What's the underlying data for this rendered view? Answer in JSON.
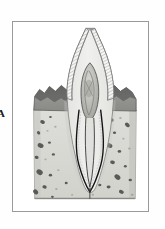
{
  "figure": {
    "label": "A",
    "caption_visible": false,
    "frame": {
      "x": 12,
      "y": 21,
      "width": 137,
      "height": 191,
      "border_color": "#9a9a9a",
      "background": "#ffffff"
    }
  },
  "colors": {
    "paper": "#ffffff",
    "page_background": "#fefefe",
    "frame_border": "#9a9a9a",
    "enamel_fill": "#f4f4f2",
    "enamel_hatch": "#8d8d8d",
    "dentin_fill": "#ececea",
    "dentin_outline": "#6f6f6f",
    "pulp_fill": "#c9c9c5",
    "pulp_outline": "#5a5a5a",
    "pulp_inner": "#9e9e99",
    "gingiva_fill": "#8f8f8c",
    "gingiva_dark": "#6e6e6b",
    "gingiva_outline": "#4a4a48",
    "bone_fill": "#d7d7d2",
    "bone_speckle": "#4f4f4d",
    "bone_speckle_light": "#8f8f8a",
    "bone_outline": "#7a7a77",
    "pdl_line": "#1c1c1c",
    "root_canal_line": "#2a2a2a"
  },
  "structures": [
    {
      "name": "enamel-crown",
      "label": "Enamel (hatched crown)",
      "shading": "fine diagonal hatch lines"
    },
    {
      "name": "dentin",
      "label": "Dentin body",
      "shading": "light flat gray"
    },
    {
      "name": "pulp-chamber",
      "label": "Pulp chamber",
      "shading": "dark gray oval with inner mottling"
    },
    {
      "name": "root-canal",
      "label": "Root canal",
      "shading": "narrow tapering channel to apex"
    },
    {
      "name": "gingiva-left",
      "label": "Gingiva (left)",
      "shading": "mid gray wedge with torn upper edge"
    },
    {
      "name": "gingiva-right",
      "label": "Gingiva (right)",
      "shading": "mid gray wedge with torn upper edge"
    },
    {
      "name": "alveolar-bone",
      "label": "Alveolar / trabecular bone",
      "shading": "light gray block with dark speckles"
    },
    {
      "name": "periodontal-ligament",
      "label": "Periodontal ligament line",
      "shading": "dark continuous outline around root"
    },
    {
      "name": "apical-foramen",
      "label": "Apex / apical region",
      "shading": "U-shaped root tip"
    }
  ],
  "bone_speckles": [
    {
      "cx": 42,
      "cy": 122,
      "rx": 2.4,
      "ry": 1.9,
      "rot": 18,
      "tone": "dark"
    },
    {
      "cx": 50,
      "cy": 117,
      "rx": 1.4,
      "ry": 1.1,
      "rot": 0,
      "tone": "dark"
    },
    {
      "cx": 38,
      "cy": 133,
      "rx": 1.8,
      "ry": 1.5,
      "rot": 40,
      "tone": "dark"
    },
    {
      "cx": 47,
      "cy": 131,
      "rx": 1.1,
      "ry": 0.9,
      "rot": 0,
      "tone": "light"
    },
    {
      "cx": 55,
      "cy": 127,
      "rx": 1.3,
      "ry": 1.0,
      "rot": 0,
      "tone": "light"
    },
    {
      "cx": 40,
      "cy": 146,
      "rx": 3.1,
      "ry": 2.3,
      "rot": 25,
      "tone": "dark"
    },
    {
      "cx": 49,
      "cy": 143,
      "rx": 1.5,
      "ry": 1.2,
      "rot": 0,
      "tone": "dark"
    },
    {
      "cx": 36,
      "cy": 158,
      "rx": 2.0,
      "ry": 1.6,
      "rot": 10,
      "tone": "dark"
    },
    {
      "cx": 45,
      "cy": 160,
      "rx": 1.2,
      "ry": 1.0,
      "rot": 0,
      "tone": "light"
    },
    {
      "cx": 53,
      "cy": 155,
      "rx": 1.6,
      "ry": 1.2,
      "rot": 0,
      "tone": "dark"
    },
    {
      "cx": 39,
      "cy": 173,
      "rx": 3.4,
      "ry": 2.6,
      "rot": 35,
      "tone": "dark"
    },
    {
      "cx": 50,
      "cy": 176,
      "rx": 1.7,
      "ry": 1.3,
      "rot": 0,
      "tone": "dark"
    },
    {
      "cx": 44,
      "cy": 188,
      "rx": 2.2,
      "ry": 1.7,
      "rot": 15,
      "tone": "dark"
    },
    {
      "cx": 56,
      "cy": 190,
      "rx": 1.3,
      "ry": 1.0,
      "rot": 0,
      "tone": "light"
    },
    {
      "cx": 35,
      "cy": 193,
      "rx": 2.9,
      "ry": 2.2,
      "rot": 50,
      "tone": "dark"
    },
    {
      "cx": 58,
      "cy": 171,
      "rx": 1.1,
      "ry": 0.9,
      "rot": 0,
      "tone": "light"
    },
    {
      "cx": 52,
      "cy": 198,
      "rx": 1.4,
      "ry": 1.1,
      "rot": 0,
      "tone": "dark"
    },
    {
      "cx": 112,
      "cy": 120,
      "rx": 2.2,
      "ry": 1.7,
      "rot": 20,
      "tone": "dark"
    },
    {
      "cx": 121,
      "cy": 118,
      "rx": 1.3,
      "ry": 1.0,
      "rot": 0,
      "tone": "light"
    },
    {
      "cx": 128,
      "cy": 125,
      "rx": 2.7,
      "ry": 2.0,
      "rot": 42,
      "tone": "dark"
    },
    {
      "cx": 115,
      "cy": 133,
      "rx": 1.6,
      "ry": 1.2,
      "rot": 0,
      "tone": "dark"
    },
    {
      "cx": 124,
      "cy": 139,
      "rx": 1.2,
      "ry": 0.9,
      "rot": 0,
      "tone": "light"
    },
    {
      "cx": 110,
      "cy": 146,
      "rx": 3.0,
      "ry": 2.2,
      "rot": 30,
      "tone": "dark"
    },
    {
      "cx": 120,
      "cy": 152,
      "rx": 1.8,
      "ry": 1.4,
      "rot": 0,
      "tone": "dark"
    },
    {
      "cx": 130,
      "cy": 149,
      "rx": 1.3,
      "ry": 1.0,
      "rot": 0,
      "tone": "light"
    },
    {
      "cx": 113,
      "cy": 163,
      "rx": 2.4,
      "ry": 1.8,
      "rot": 12,
      "tone": "dark"
    },
    {
      "cx": 126,
      "cy": 167,
      "rx": 1.5,
      "ry": 1.2,
      "rot": 0,
      "tone": "dark"
    },
    {
      "cx": 118,
      "cy": 178,
      "rx": 3.3,
      "ry": 2.4,
      "rot": 38,
      "tone": "dark"
    },
    {
      "cx": 131,
      "cy": 181,
      "rx": 1.7,
      "ry": 1.3,
      "rot": 0,
      "tone": "dark"
    },
    {
      "cx": 109,
      "cy": 188,
      "rx": 2.0,
      "ry": 1.5,
      "rot": 0,
      "tone": "dark"
    },
    {
      "cx": 122,
      "cy": 193,
      "rx": 2.6,
      "ry": 1.9,
      "rot": 22,
      "tone": "dark"
    },
    {
      "cx": 133,
      "cy": 196,
      "rx": 1.4,
      "ry": 1.1,
      "rot": 0,
      "tone": "light"
    },
    {
      "cx": 66,
      "cy": 184,
      "rx": 1.5,
      "ry": 1.2,
      "rot": 0,
      "tone": "dark"
    },
    {
      "cx": 100,
      "cy": 186,
      "rx": 1.7,
      "ry": 1.3,
      "rot": 0,
      "tone": "dark"
    },
    {
      "cx": 93,
      "cy": 196,
      "rx": 1.3,
      "ry": 1.0,
      "rot": 0,
      "tone": "light"
    },
    {
      "cx": 72,
      "cy": 196,
      "rx": 1.2,
      "ry": 0.9,
      "rot": 0,
      "tone": "light"
    }
  ]
}
